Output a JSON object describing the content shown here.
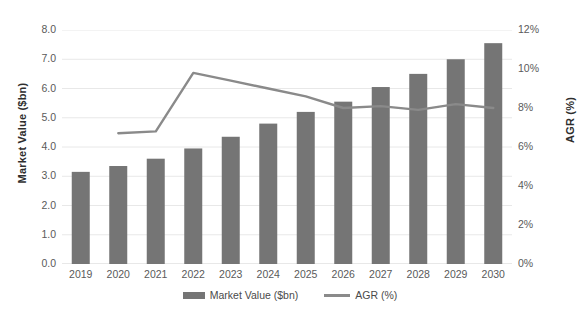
{
  "chart_data": {
    "type": "bar",
    "title": "",
    "subtitle": "",
    "xlabel": "",
    "ylabel": "Market Value ($bn)",
    "y2label": "AGR (%)",
    "grid": true,
    "legend_position": "bottom",
    "categories": [
      "2019",
      "2020",
      "2021",
      "2022",
      "2023",
      "2024",
      "2025",
      "2026",
      "2027",
      "2028",
      "2029",
      "2030"
    ],
    "ylim": [
      0.0,
      8.0
    ],
    "y2lim": [
      0,
      12
    ],
    "yticks": [
      "0.0",
      "1.0",
      "2.0",
      "3.0",
      "4.0",
      "5.0",
      "6.0",
      "7.0",
      "8.0"
    ],
    "y2ticks": [
      "0%",
      "2%",
      "4%",
      "6%",
      "8%",
      "10%",
      "12%"
    ],
    "series": [
      {
        "name": "Market Value ($bn)",
        "type": "bar",
        "axis": "left",
        "color": "#757575",
        "values": [
          3.15,
          3.35,
          3.6,
          3.95,
          4.35,
          4.8,
          5.2,
          5.55,
          6.05,
          6.5,
          7.0,
          7.55
        ]
      },
      {
        "name": "AGR (%)",
        "type": "line",
        "axis": "right",
        "color": "#8a8a8a",
        "values": [
          null,
          6.7,
          6.8,
          9.8,
          9.4,
          9.0,
          8.6,
          8.0,
          8.1,
          7.9,
          8.2,
          8.0
        ]
      }
    ],
    "legend": [
      "Market Value ($bn)",
      "AGR (%)"
    ]
  },
  "axes": {
    "left_title": "Market Value ($bn)",
    "right_title": "AGR (%)"
  },
  "legend": {
    "items": [
      {
        "label": "Market Value ($bn)",
        "marker": "bar-swatch"
      },
      {
        "label": "AGR (%)",
        "marker": "line-swatch"
      }
    ]
  },
  "colors": {
    "bar": "#757575",
    "line": "#8a8a8a",
    "grid": "#e8e8e8",
    "text": "#5a5a5a",
    "background": "#ffffff"
  }
}
